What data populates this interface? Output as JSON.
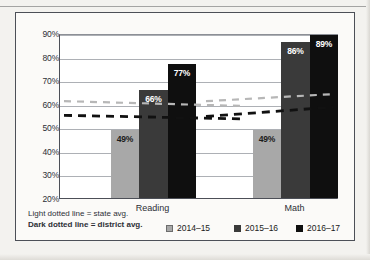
{
  "chart_data": {
    "type": "bar",
    "title": "",
    "xlabel": "",
    "ylabel": "",
    "categories": [
      "Reading",
      "Math"
    ],
    "ylim": [
      20,
      90
    ],
    "ytick_labels": [
      "20%",
      "30%",
      "40%",
      "50%",
      "60%",
      "70%",
      "80%",
      "90%"
    ],
    "ytick_values": [
      20,
      30,
      40,
      50,
      60,
      70,
      80,
      90
    ],
    "grid": true,
    "legend_position": "bottom-right",
    "series": [
      {
        "name": "2014–15",
        "color": "#a8a8a8",
        "values": [
          49,
          49
        ],
        "labels": [
          "49%",
          "49%"
        ]
      },
      {
        "name": "2015–16",
        "color": "#3a3a3a",
        "values": [
          66,
          86
        ],
        "labels": [
          "66%",
          "86%"
        ]
      },
      {
        "name": "2016–17",
        "color": "#0f0f0f",
        "values": [
          89,
          89
        ],
        "labels": [
          "77%",
          "89%"
        ]
      }
    ],
    "bar_values": {
      "Reading": {
        "2014–15": 49,
        "2015–16": 66,
        "2016–17": 77
      },
      "Math": {
        "2014–15": 49,
        "2015–16": 86,
        "2016–17": 89
      }
    },
    "reference_lines": [
      {
        "name": "state avg.",
        "style": "light dotted",
        "color": "#b7b7b7",
        "segments": [
          {
            "category": "Reading",
            "start": 61.5,
            "end": 59.5
          },
          {
            "category": "Math",
            "start": 61.5,
            "end": 64.5
          }
        ]
      },
      {
        "name": "district avg.",
        "style": "dark dotted",
        "color": "#111111",
        "segments": [
          {
            "category": "Reading",
            "start": 55.5,
            "end": 54.0
          },
          {
            "category": "Math",
            "start": 55.0,
            "end": 59.0
          }
        ]
      }
    ],
    "annotations": [
      "Light dotted line = state avg.",
      "Dark dotted line = district avg."
    ]
  },
  "legend": {
    "note_line1": "Light dotted line = state avg.",
    "note_line2": "Dark dotted line = district avg.",
    "items": [
      {
        "label": "2014–15"
      },
      {
        "label": "2015–16"
      },
      {
        "label": "2016–17"
      }
    ]
  }
}
